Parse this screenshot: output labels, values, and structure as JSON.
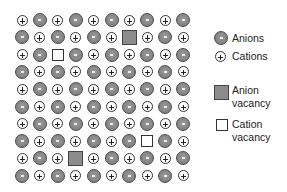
{
  "diagram": {
    "type": "ionic-crystal-lattice",
    "rows": 10,
    "cols": 10,
    "grid": [
      [
        "C",
        "A",
        "C",
        "A",
        "C",
        "A",
        "C",
        "A",
        "C",
        "A"
      ],
      [
        "A",
        "C",
        "A",
        "C",
        "A",
        "C",
        "AV",
        "C",
        "A",
        "C"
      ],
      [
        "C",
        "A",
        "CV",
        "A",
        "C",
        "A",
        "C",
        "A",
        "C",
        "A"
      ],
      [
        "A",
        "C",
        "A",
        "C",
        "A",
        "C",
        "A",
        "C",
        "A",
        "C"
      ],
      [
        "C",
        "A",
        "C",
        "A",
        "C",
        "A",
        "C",
        "A",
        "C",
        "A"
      ],
      [
        "A",
        "C",
        "A",
        "C",
        "A",
        "C",
        "A",
        "C",
        "A",
        "C"
      ],
      [
        "C",
        "A",
        "C",
        "A",
        "C",
        "A",
        "C",
        "A",
        "C",
        "A"
      ],
      [
        "A",
        "C",
        "A",
        "C",
        "A",
        "C",
        "A",
        "CV",
        "A",
        "C"
      ],
      [
        "C",
        "A",
        "C",
        "AV",
        "C",
        "A",
        "C",
        "A",
        "C",
        "A"
      ],
      [
        "A",
        "C",
        "A",
        "C",
        "A",
        "C",
        "A",
        "C",
        "A",
        "C"
      ]
    ],
    "key": {
      "A": "anion",
      "C": "cation",
      "AV": "anion-vacancy",
      "CV": "cation-vacancy"
    },
    "colors": {
      "anion_fill": "#868686",
      "anion_border": "#4a4a4a",
      "cation_fill": "#ffffff",
      "cation_border": "#333333",
      "anion_vacancy_fill": "#8c8c8c",
      "cation_vacancy_fill": "#ffffff"
    }
  },
  "legend": {
    "items": [
      {
        "id": "anion",
        "symbol": "gray-circle-minus",
        "label_line1": "Anions",
        "label_line2": ""
      },
      {
        "id": "cation",
        "symbol": "white-circle-plus",
        "label_line1": "Cations",
        "label_line2": ""
      },
      {
        "id": "anion-vacancy",
        "symbol": "gray-square",
        "label_line1": "Anion",
        "label_line2": "vacancy"
      },
      {
        "id": "cation-vacancy",
        "symbol": "white-square",
        "label_line1": "Cation",
        "label_line2": "vacancy"
      }
    ]
  }
}
